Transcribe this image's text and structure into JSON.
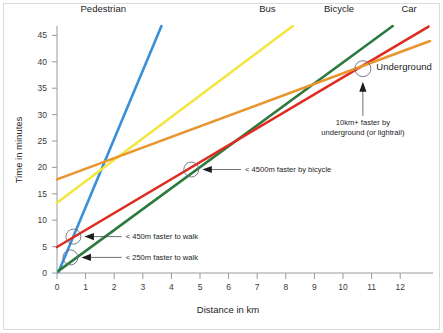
{
  "chart_data": {
    "type": "line",
    "title": "",
    "xlabel": "Distance in km",
    "ylabel": "Time in minutes",
    "xlim": [
      0,
      12.6
    ],
    "ylim": [
      0,
      47.5
    ],
    "xticks": [
      0,
      1,
      2,
      3,
      4,
      5,
      6,
      7,
      8,
      9,
      10,
      11,
      12
    ],
    "yticks": [
      0,
      5,
      10,
      15,
      20,
      25,
      30,
      35,
      40,
      45
    ],
    "xtick_labels": [
      "0",
      "1",
      "2",
      "3",
      "4",
      "5",
      "6",
      "7",
      "8",
      "9",
      "10",
      "11",
      "12"
    ],
    "ytick_labels": [
      "0",
      "5",
      "10",
      "15",
      "20",
      "25",
      "30",
      "35",
      "40",
      "45"
    ],
    "grid": false,
    "legend_position": "line-end-labels",
    "series": [
      {
        "name": "Pedestrian",
        "color": "#3a8fd9",
        "x": [
          0.05,
          3.5
        ],
        "values": [
          0.2,
          47.5
        ],
        "label_x": 1.55,
        "label_y": 50.2
      },
      {
        "name": "Bus",
        "color": "#f2e63f",
        "x": [
          0.0,
          7.9
        ],
        "values": [
          13.5,
          47.5
        ],
        "label_x": 7.05,
        "label_y": 50.2
      },
      {
        "name": "Bicycle",
        "color": "#2d7a3e",
        "x": [
          0.05,
          11.25
        ],
        "values": [
          0.4,
          47.5
        ],
        "label_x": 9.45,
        "label_y": 50.2
      },
      {
        "name": "Car",
        "color": "#e02b20",
        "x": [
          0.0,
          12.45
        ],
        "values": [
          5.0,
          47.4
        ],
        "label_x": 11.8,
        "label_y": 50.2
      },
      {
        "name": "Underground",
        "color": "#e8952e",
        "x": [
          0.0,
          12.5
        ],
        "values": [
          18.0,
          44.6
        ],
        "label_x": 10.7,
        "label_y": 39.0
      }
    ],
    "annotations": [
      {
        "text": "< 250m faster to walk",
        "marker_x": 0.45,
        "marker_y": 3.0,
        "text_x": 2.3,
        "text_y": 2.6
      },
      {
        "text": "< 450m faster to walk",
        "marker_x": 0.55,
        "marker_y": 7.0,
        "text_x": 2.3,
        "text_y": 6.6
      },
      {
        "text": "< 4500m faster by bicycle",
        "marker_x": 4.5,
        "marker_y": 19.9,
        "text_x": 6.3,
        "text_y": 19.5
      },
      {
        "text": "10km+ faster by underground (or lightrail)",
        "line1": "10km+ faster by",
        "line2": "underground (or lightrail)",
        "marker_x": 10.25,
        "marker_y": 39.3,
        "text_x": 10.25,
        "text_y": 28.5
      }
    ]
  }
}
